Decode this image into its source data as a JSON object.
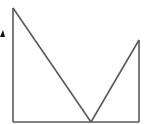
{
  "diagram": {
    "stroke_color": "#5a5a5a",
    "marker_color": "#111111",
    "points": {
      "top_left": [
        13,
        8
      ],
      "bottom_left": [
        13,
        122
      ],
      "bottom_vertex": [
        91,
        122
      ],
      "right_peak": [
        139,
        40
      ],
      "bottom_right": [
        139,
        122
      ]
    },
    "marker": {
      "shape": "small filled triangle (partially visible)",
      "position": [
        2,
        34
      ]
    }
  }
}
